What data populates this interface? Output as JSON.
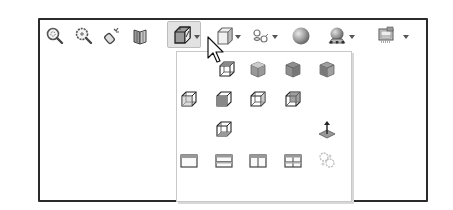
{
  "toolbar": {
    "items": [
      {
        "name": "zoom-to-fit",
        "icon": "zoom-to-fit-icon",
        "has_dropdown": false
      },
      {
        "name": "zoom-to-area",
        "icon": "zoom-to-area-icon",
        "has_dropdown": false
      },
      {
        "name": "previous-view",
        "icon": "previous-view-icon",
        "has_dropdown": false
      },
      {
        "name": "section-view",
        "icon": "section-view-icon",
        "has_dropdown": false
      },
      {
        "name": "view-orientation",
        "icon": "view-orientation-icon",
        "has_dropdown": true,
        "active": true
      },
      {
        "name": "display-style",
        "icon": "display-style-icon",
        "has_dropdown": true
      },
      {
        "name": "hide-show-items",
        "icon": "hide-show-items-icon",
        "has_dropdown": true
      },
      {
        "name": "edit-appearance",
        "icon": "appearance-sphere-icon",
        "has_dropdown": false
      },
      {
        "name": "apply-scene",
        "icon": "scene-icon",
        "has_dropdown": true
      },
      {
        "name": "view-settings",
        "icon": "view-settings-icon",
        "has_dropdown": true
      }
    ]
  },
  "view_orientation_menu": {
    "rows": [
      [
        "front-view-icon",
        "back-view-icon",
        "left-view-icon",
        "right-view-icon"
      ],
      [
        "top-view-icon",
        "bottom-view-icon",
        "isometric-view-icon",
        "trimetric-view-icon"
      ],
      [
        "dimetric-view-icon",
        "normal-to-icon"
      ],
      [
        "single-view-icon",
        "two-view-horizontal-icon",
        "two-view-vertical-icon",
        "four-view-icon",
        "link-views-icon"
      ]
    ]
  },
  "colors": {
    "frame_border": "#2b2b2b",
    "panel_border": "#c8c8c8",
    "active_button_bg": "#e2e2e2",
    "icon_dark": "#3a3a3a",
    "icon_mid": "#8a8a8a"
  }
}
